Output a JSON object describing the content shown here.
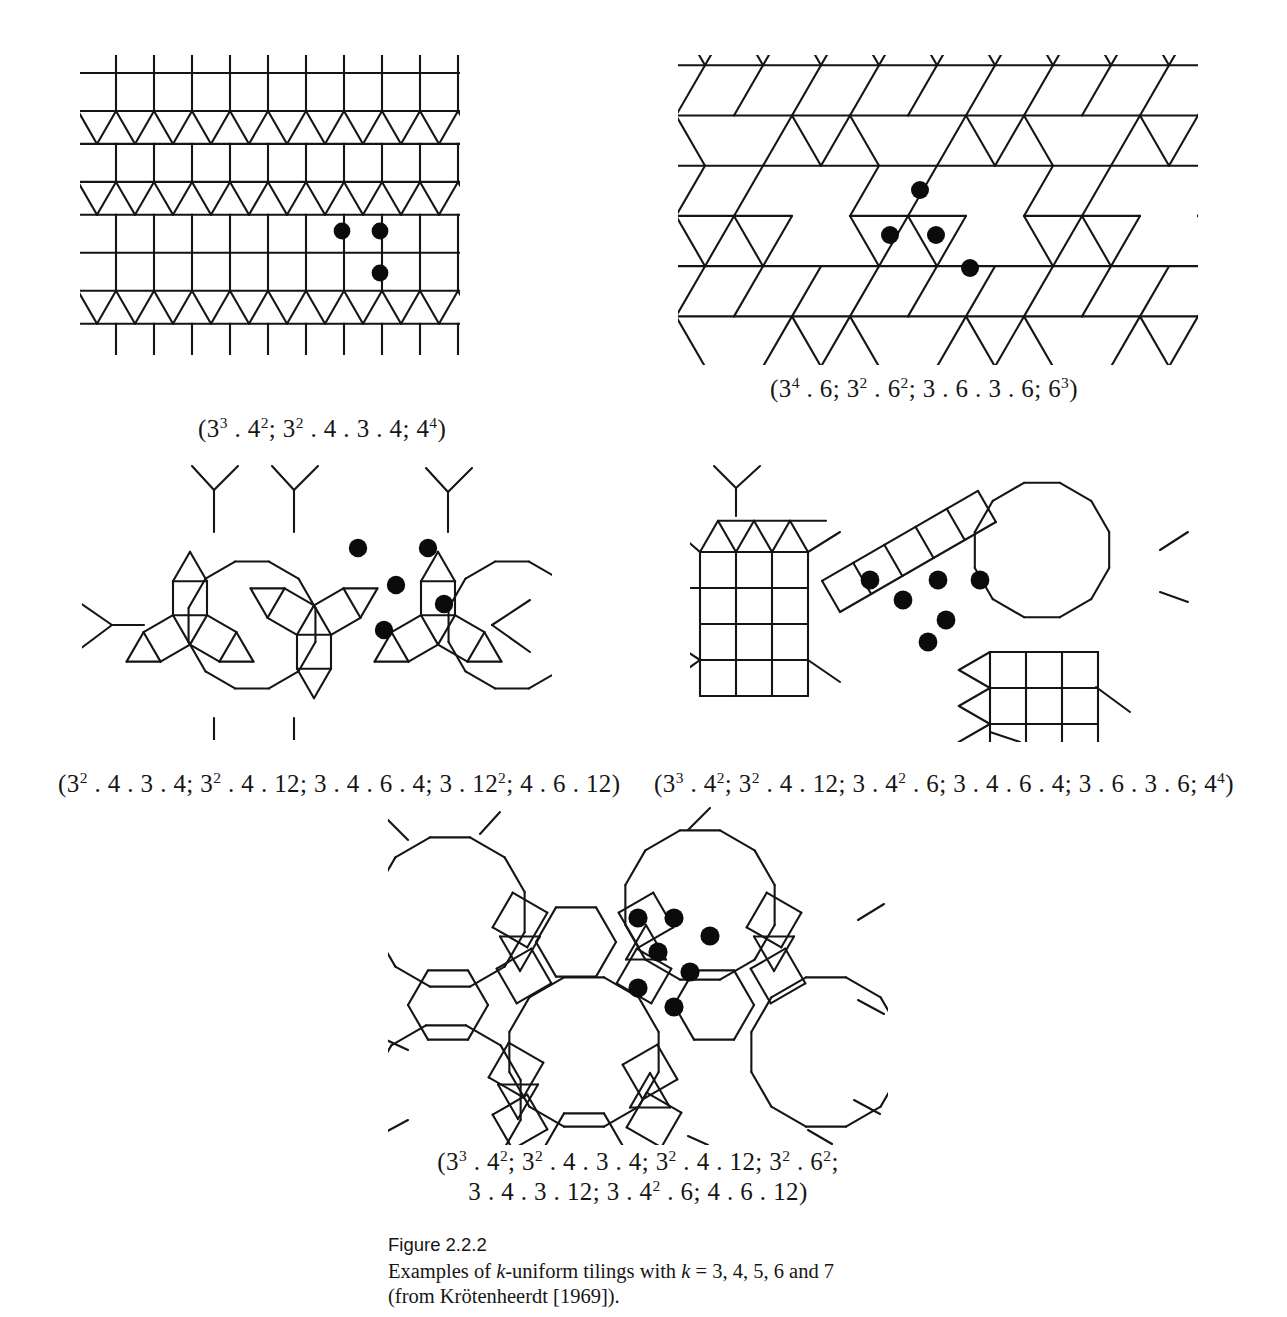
{
  "figure": {
    "number_label": "Figure 2.2.2",
    "caption_line1_pre": "Examples of ",
    "caption_line1_italic_k": "k",
    "caption_line1_mid": "-uniform tilings with ",
    "caption_line1_italic_k2": "k",
    "caption_line1_post": "  =  3, 4, 5, 6 and 7",
    "caption_line2": "(from Krötenheerdt [1969])."
  },
  "ink_color": "#151515",
  "vertex_color": "#0b0b0b",
  "tilings": [
    {
      "id": "tiling-3-uniform",
      "k": 3,
      "marked_vertices": 3,
      "caption_plain": "(3³ . 4²; 3² . 4 . 3 . 4; 4⁴)",
      "caption_parts": [
        {
          "base": "(3",
          "sup": "3"
        },
        {
          "base": " . 4",
          "sup": "2"
        },
        {
          "base": "; 3",
          "sup": "2"
        },
        {
          "base": " . 4 . 3 . 4; 4",
          "sup": "4"
        },
        {
          "base": ")",
          "sup": ""
        }
      ],
      "kind": "square-triangle"
    },
    {
      "id": "tiling-4-uniform",
      "k": 4,
      "marked_vertices": 4,
      "caption_plain": "(3⁴ . 6; 3² . 6²; 3 . 6 . 3 . 6; 6³)",
      "caption_parts": [
        {
          "base": "(3",
          "sup": "4"
        },
        {
          "base": " . 6; 3",
          "sup": "2"
        },
        {
          "base": " . 6",
          "sup": "2"
        },
        {
          "base": "; 3 . 6 . 3 . 6; 6",
          "sup": "3"
        },
        {
          "base": ")",
          "sup": ""
        }
      ],
      "kind": "triangle-hexagon"
    },
    {
      "id": "tiling-5-uniform",
      "k": 5,
      "marked_vertices": 5,
      "caption_plain": "(3² . 4 . 3 . 4; 3² . 4 . 12; 3 . 4 . 6 . 4; 3 . 12²; 4 . 6 . 12)",
      "caption_parts": [
        {
          "base": "(3",
          "sup": "2"
        },
        {
          "base": " . 4 . 3 . 4; 3",
          "sup": "2"
        },
        {
          "base": " . 4 . 12; 3 . 4 . 6 . 4; 3 . 12",
          "sup": "2"
        },
        {
          "base": "; 4 . 6 . 12)",
          "sup": ""
        }
      ],
      "kind": "dodecagon-rosette"
    },
    {
      "id": "tiling-6-uniform",
      "k": 6,
      "marked_vertices": 6,
      "caption_plain": "(3³ . 4²; 3² . 4 . 12; 3 . 4² . 6; 3 . 4 . 6 . 4; 3 . 6 . 3 . 6; 4⁴)",
      "caption_parts": [
        {
          "base": "(3",
          "sup": "3"
        },
        {
          "base": " . 4",
          "sup": "2"
        },
        {
          "base": "; 3",
          "sup": "2"
        },
        {
          "base": " . 4 . 12; 3 . 4",
          "sup": "2"
        },
        {
          "base": " . 6; 3 . 4 . 6 . 4; 3 . 6 . 3 . 6; 4",
          "sup": "4"
        },
        {
          "base": ")",
          "sup": ""
        }
      ],
      "kind": "mixed-dodecagon-square"
    },
    {
      "id": "tiling-7-uniform",
      "k": 7,
      "marked_vertices": 7,
      "caption_plain": "(3³ . 4²; 3² . 4 . 3 . 4; 3² . 4 . 12; 3² . 6²; 3 . 4 . 3 . 12; 3 . 4² . 6; 4 . 6 . 12)",
      "caption_line1_parts": [
        {
          "base": "(3",
          "sup": "3"
        },
        {
          "base": " . 4",
          "sup": "2"
        },
        {
          "base": "; 3",
          "sup": "2"
        },
        {
          "base": " . 4 . 3 . 4; 3",
          "sup": "2"
        },
        {
          "base": " . 4 . 12; 3",
          "sup": "2"
        },
        {
          "base": " . 6",
          "sup": "2"
        },
        {
          "base": ";",
          "sup": ""
        }
      ],
      "caption_line2_parts": [
        {
          "base": "3 . 4 . 3 . 12; 3 . 4",
          "sup": "2"
        },
        {
          "base": " . 6; 4 . 6 . 12)",
          "sup": ""
        }
      ],
      "kind": "dodecagon-large"
    }
  ]
}
